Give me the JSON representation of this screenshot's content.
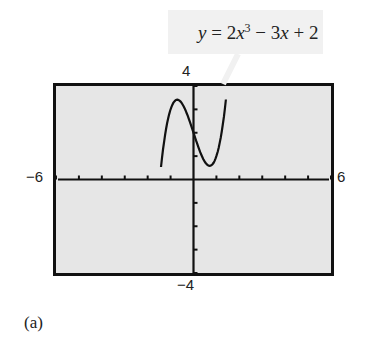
{
  "chart_data": {
    "type": "line",
    "title": "",
    "equation": "y = 2x^3 - 3x + 2",
    "xlim": [
      -6,
      6
    ],
    "ylim": [
      -4,
      4
    ],
    "xlabel": "",
    "ylabel": "",
    "x_ticks": [
      -6,
      -5,
      -4,
      -3,
      -2,
      -1,
      0,
      1,
      2,
      3,
      4,
      5,
      6
    ],
    "y_ticks": [
      -4,
      -3,
      -2,
      -1,
      0,
      1,
      2,
      3,
      4
    ],
    "grid": false,
    "series": [
      {
        "name": "y = 2x^3 - 3x + 2",
        "x": [
          -1.4,
          -1.2,
          -1.0,
          -0.7071,
          -0.4,
          0,
          0.4,
          0.7071,
          1.0,
          1.2,
          1.4
        ],
        "y": [
          -4.0,
          2.14,
          3.0,
          3.414,
          3.07,
          2.0,
          0.928,
          0.586,
          1.0,
          1.856,
          3.288
        ]
      }
    ],
    "window_labels": {
      "xmin": "-6",
      "xmax": "6",
      "ymin": "-4",
      "ymax": "4"
    }
  },
  "labels": {
    "equation_text": "y = 2x³ − 3x + 2",
    "xmin": "−6",
    "xmax": "6",
    "ymin": "−4",
    "ymax": "4",
    "caption": "(a)"
  }
}
